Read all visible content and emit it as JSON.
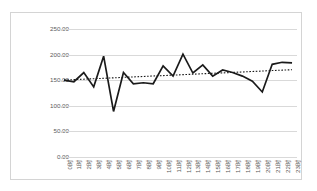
{
  "chart_data": {
    "type": "line",
    "title": "",
    "xlabel": "",
    "ylabel": "",
    "ylim": [
      0,
      250
    ],
    "ytick_values": [
      0,
      50,
      100,
      150,
      200,
      250
    ],
    "ytick_labels": [
      "0.00",
      "50.00",
      "100.00",
      "150.00",
      "200.00",
      "250.00"
    ],
    "grid": true,
    "legend": "none",
    "categories": [
      "0时",
      "1时",
      "2时",
      "3时",
      "4时",
      "5时",
      "6时",
      "7时",
      "8时",
      "9时",
      "10时",
      "11时",
      "12时",
      "13时",
      "14时",
      "15时",
      "16时",
      "17时",
      "18时",
      "19时",
      "20时",
      "21时",
      "22时",
      "23时"
    ],
    "series": [
      {
        "name": "value",
        "style": "solid",
        "color": "#1a1a1a",
        "values": [
          150,
          147,
          165,
          137,
          197,
          89,
          165,
          143,
          145,
          143,
          178,
          158,
          201,
          164,
          180,
          158,
          170,
          165,
          158,
          148,
          127,
          181,
          185,
          184
        ]
      },
      {
        "name": "trendline",
        "style": "dotted",
        "color": "#1a1a1a",
        "values": [
          150.2,
          151.1,
          152.0,
          152.9,
          153.7,
          154.6,
          155.5,
          156.4,
          157.3,
          158.2,
          159.0,
          159.9,
          160.8,
          161.7,
          162.6,
          163.5,
          164.3,
          165.2,
          166.1,
          167.0,
          167.9,
          168.8,
          169.6,
          170.5
        ]
      }
    ]
  },
  "colors": {
    "gridline": "#d9d9d9",
    "border": "#d4d4d4",
    "tick_text": "#595959",
    "series": "#1a1a1a"
  }
}
